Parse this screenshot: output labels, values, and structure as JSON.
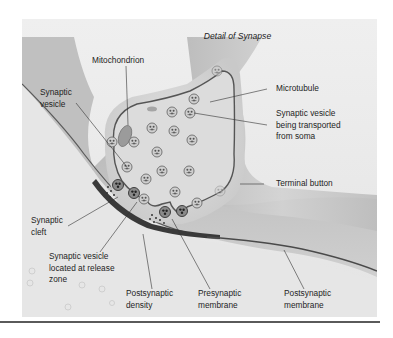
{
  "figure": {
    "title": "Detail of Synapse",
    "labels": {
      "mitochondrion": "Mitochondrion",
      "synaptic_vesicle": "Synaptic\nvesicle",
      "microtubule": "Microtubule",
      "vesicle_transported": "Synaptic vesicle\nbeing transported\nfrom soma",
      "terminal_button": "Terminal button",
      "synaptic_cleft": "Synaptic\ncleft",
      "vesicle_release_zone": "Synaptic vesicle\nlocated at release\nzone",
      "postsynaptic_density": "Postsynaptic\ndensity",
      "presynaptic_membrane": "Presynaptic\nmembrane",
      "postsynaptic_membrane": "Postsynaptic\nmembrane"
    },
    "colors": {
      "background": "#ececec",
      "axon": "#c4c4c4",
      "terminal_fill": "#d6d6d6",
      "membrane": "#505050",
      "postsynaptic_density": "#3a3a3a",
      "vesicle": "#9a9a9a"
    }
  }
}
